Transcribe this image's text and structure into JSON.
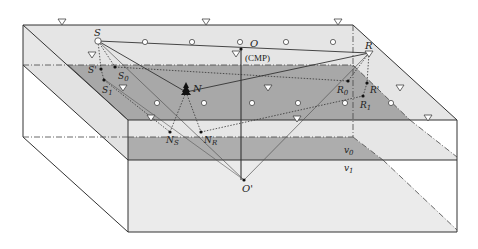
{
  "diagram": {
    "type": "3D seismic acquisition geometry block diagram",
    "labels": {
      "source": "S",
      "source_prime": "S'",
      "source_0": "S",
      "source_0_sub": "0",
      "source_1": "S",
      "source_1_sub": "1",
      "cmp_point": "O",
      "cmp_text": "(CMP)",
      "receiver": "R",
      "receiver_prime": "R'",
      "receiver_0": "R",
      "receiver_0_sub": "0",
      "receiver_1": "R",
      "receiver_1_sub": "1",
      "scatter_point": "N",
      "ns_point": "N",
      "ns_sub": "S",
      "nr_point": "N",
      "nr_sub": "R",
      "reflection_point": "O'",
      "velocity_upper": "v",
      "velocity_upper_sub": "0",
      "velocity_lower": "v",
      "velocity_lower_sub": "1"
    },
    "legend_symbols": {
      "receiver_marker": "inverted-triangle",
      "source_marker": "open-circle",
      "scatterer_marker": "tree-shape"
    },
    "colors": {
      "top_face": "#e6e6e6",
      "reflector_plane": "#a9a9a9",
      "front_upper": "#e8e8e8",
      "front_dark_band": "#b0b0b0",
      "front_lower": "#ececec",
      "side_face": "#e4e4e4",
      "line": "#333333"
    }
  }
}
